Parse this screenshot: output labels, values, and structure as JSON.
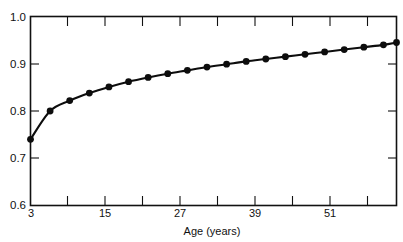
{
  "caption": {
    "text": "increase in reliability by age"
  },
  "chart_data": {
    "type": "line",
    "title": "",
    "subtitle": "",
    "xlabel": "Age (years)",
    "ylabel": "",
    "xlim": [
      3,
      59
    ],
    "ylim": [
      0.6,
      1.0
    ],
    "grid": false,
    "legend": null,
    "legend_position": "none",
    "marker": "filled-circle",
    "x_ticks_major": [
      3,
      15,
      27,
      39,
      51
    ],
    "x_tick_labels": [
      "3",
      "15",
      "27",
      "39",
      "51"
    ],
    "x_ticks_minor": [
      9,
      21,
      33,
      45,
      57
    ],
    "y_ticks": [
      0.6,
      0.7,
      0.8,
      0.9,
      1.0
    ],
    "y_tick_labels": [
      "0.6",
      "0.7",
      "0.8",
      "0.9",
      "1.0"
    ],
    "series": [
      {
        "name": "reliability",
        "x": [
          3,
          6,
          9,
          12,
          15,
          18,
          21,
          24,
          27,
          30,
          33,
          36,
          39,
          42,
          45,
          48,
          51,
          54,
          57,
          59
        ],
        "values": [
          0.74,
          0.8,
          0.822,
          0.838,
          0.851,
          0.862,
          0.871,
          0.879,
          0.886,
          0.893,
          0.899,
          0.905,
          0.91,
          0.915,
          0.92,
          0.925,
          0.93,
          0.935,
          0.94,
          0.945
        ]
      }
    ],
    "colors": {
      "line": "#0d0d0d",
      "marker": "#0d0d0d",
      "axis": "#111111",
      "background": "#ffffff"
    }
  },
  "axes": {
    "x_axis_title": "Age (years)"
  }
}
